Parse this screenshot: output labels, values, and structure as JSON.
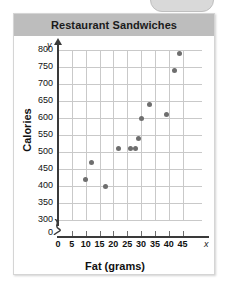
{
  "card": {
    "title": "Restaurant Sandwiches"
  },
  "axes": {
    "x_variable": "x",
    "y_variable": "y",
    "zero_label": "0"
  },
  "chart_data": {
    "type": "scatter",
    "title": "Restaurant Sandwiches",
    "xlabel": "Fat (grams)",
    "ylabel": "Calories",
    "xlim": [
      0,
      47
    ],
    "ylim": [
      290,
      820
    ],
    "grid": true,
    "legend": "none",
    "y_axis_break": true,
    "xticks": [
      0,
      5,
      10,
      15,
      20,
      25,
      30,
      35,
      40,
      45
    ],
    "yticks": [
      300,
      350,
      400,
      450,
      500,
      550,
      600,
      650,
      700,
      750,
      800
    ],
    "points": [
      {
        "x": 10,
        "y": 420
      },
      {
        "x": 12,
        "y": 470
      },
      {
        "x": 17,
        "y": 400
      },
      {
        "x": 22,
        "y": 510
      },
      {
        "x": 26,
        "y": 510
      },
      {
        "x": 28,
        "y": 510
      },
      {
        "x": 29,
        "y": 540
      },
      {
        "x": 30,
        "y": 600
      },
      {
        "x": 33,
        "y": 640
      },
      {
        "x": 39,
        "y": 610
      },
      {
        "x": 42,
        "y": 740
      },
      {
        "x": 44,
        "y": 790
      }
    ]
  }
}
